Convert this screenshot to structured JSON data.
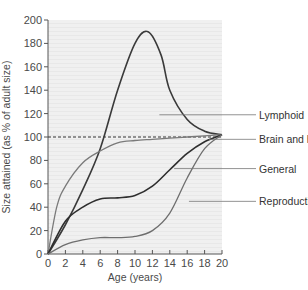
{
  "chart_data": {
    "type": "line",
    "title": "",
    "xlabel": "Age (years)",
    "ylabel": "Size attained (as % of adult size)",
    "xlim": [
      0,
      20
    ],
    "ylim": [
      0,
      200
    ],
    "xticks": [
      0,
      2,
      4,
      6,
      8,
      10,
      12,
      14,
      16,
      18,
      20
    ],
    "yticks": [
      0,
      20,
      40,
      60,
      80,
      100,
      120,
      140,
      160,
      180,
      200
    ],
    "grid": false,
    "reference_line": {
      "y": 100,
      "style": "dashed"
    },
    "legend_position": "right, leader lines",
    "series": [
      {
        "name": "Lymphoid",
        "color": "#3a3a3a",
        "x": [
          0,
          2,
          4,
          6,
          8,
          10,
          11.5,
          13,
          14,
          16,
          18,
          20
        ],
        "values": [
          0,
          25,
          55,
          90,
          140,
          180,
          190,
          170,
          140,
          115,
          105,
          102
        ],
        "label_y": 119
      },
      {
        "name": "Brain and head",
        "color": "#7a7a7a",
        "x": [
          0,
          1,
          2,
          4,
          6,
          8,
          10,
          12,
          14,
          16,
          18,
          20
        ],
        "values": [
          0,
          40,
          58,
          78,
          88,
          95,
          97,
          98,
          99,
          100,
          101,
          102
        ],
        "label_y": 98
      },
      {
        "name": "General",
        "color": "#2e2e2e",
        "x": [
          0,
          2,
          4,
          6,
          8,
          10,
          12,
          14,
          16,
          18,
          20
        ],
        "values": [
          0,
          28,
          40,
          47,
          48,
          50,
          58,
          72,
          86,
          96,
          102
        ],
        "label_y": 73
      },
      {
        "name": "Reproductive",
        "color": "#6e6e6e",
        "x": [
          0,
          2,
          4,
          6,
          8,
          10,
          12,
          14,
          16,
          18,
          20
        ],
        "values": [
          0,
          8,
          12,
          14,
          14,
          15,
          20,
          35,
          65,
          90,
          102
        ],
        "label_y": 45
      }
    ]
  },
  "labels": {
    "xlabel": "Age (years)",
    "ylabel": "Size attained (as % of adult size)",
    "lymphoid": "Lymphoid",
    "brain": "Brain and head",
    "general": "General",
    "reproductive": "Reproductive"
  }
}
